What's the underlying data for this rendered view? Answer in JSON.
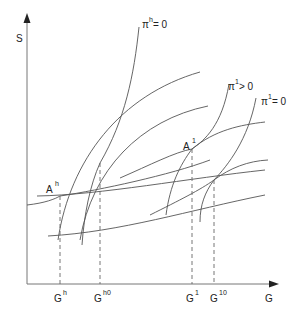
{
  "axes": {
    "y_label": "S",
    "x_label": "G"
  },
  "points": {
    "Ah": {
      "base": "A",
      "sup": "h"
    },
    "A1": {
      "base": "A",
      "sup": "1"
    }
  },
  "curve_labels": {
    "pi_h_zero": {
      "base": "π",
      "sup": "h",
      "rest": " = 0"
    },
    "pi_1_pos": {
      "base": "π",
      "sup": "1",
      "rest": " > 0"
    },
    "pi_1_zero": {
      "base": "π",
      "sup": "1",
      "rest": " = 0"
    }
  },
  "x_ticks": [
    {
      "base": "G",
      "sup": "h"
    },
    {
      "base": "G",
      "sup": "h0"
    },
    {
      "base": "G",
      "sup": "1"
    },
    {
      "base": "G",
      "sup": "10"
    }
  ]
}
